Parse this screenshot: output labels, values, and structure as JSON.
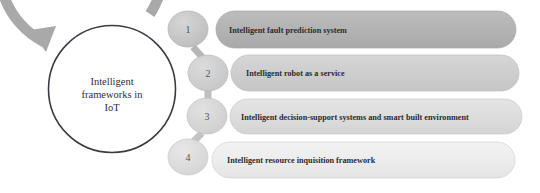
{
  "diagram": {
    "type": "circular-process-with-list",
    "center": {
      "lines": [
        "Intelligent",
        "frameworks in",
        "IoT"
      ],
      "text": "Intelligent frameworks in IoT",
      "ring_color": "#3b3b41",
      "arrow_color": "#a8a8a8"
    },
    "steps": [
      {
        "number": "1",
        "label": "Intelligent fault prediction system",
        "pill_color": "#b4b4b4",
        "circle_color": "#c6c6c6"
      },
      {
        "number": "2",
        "label": "Intelligent robot as a service",
        "pill_color": "#cfcfcf",
        "circle_color": "#cdcdcd"
      },
      {
        "number": "3",
        "label": "Intelligent decision-support systems and smart built environment",
        "pill_color": "#dedede",
        "circle_color": "#d4d4d4"
      },
      {
        "number": "4",
        "label": "Intelligent resource inquisition framework",
        "pill_color": "#ededed",
        "circle_color": "#dbdbdb"
      }
    ]
  }
}
